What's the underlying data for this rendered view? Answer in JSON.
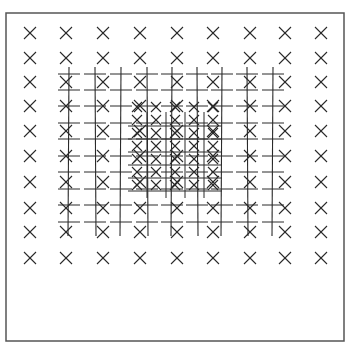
{
  "figure": {
    "frame": {
      "x": 6,
      "y": 13,
      "width": 338,
      "height": 328,
      "stroke": "#555555"
    },
    "ink_color": "#2a2a2a",
    "outer_markers": {
      "symbol": "x-mark",
      "size": 6,
      "columns_x": [
        30,
        66,
        103,
        140,
        177,
        213,
        250,
        285,
        321
      ],
      "rows_y": [
        33,
        58,
        82,
        106,
        131,
        156,
        182,
        208,
        232,
        258
      ]
    },
    "grid_lines": {
      "vertical_x": [
        69,
        95,
        121,
        147,
        172,
        197,
        222,
        247,
        273
      ],
      "y_start": 67,
      "y_end": 236,
      "dash_rows_y": [
        74,
        90,
        106,
        123,
        139,
        156,
        172,
        189,
        205,
        222
      ],
      "dash_half_length": 11
    },
    "inner_markers": {
      "symbol": "x-mark",
      "size": 5,
      "columns_x": [
        137,
        156,
        175,
        194,
        213
      ],
      "rows_y": [
        107,
        120,
        133,
        146,
        159,
        172,
        185
      ]
    },
    "inner_fine_lines": {
      "vertical_x": [
        147,
        166,
        185,
        204
      ],
      "y_start": 112,
      "y_end": 198,
      "horizontal_y": [
        126,
        139,
        152,
        165,
        178,
        191
      ],
      "x_start": 128,
      "x_end": 222
    }
  }
}
